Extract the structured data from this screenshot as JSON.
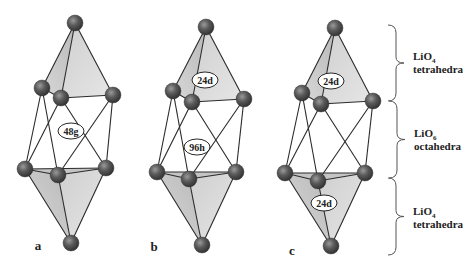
{
  "figure": {
    "background": "#ffffff",
    "colors": {
      "atom_fill": "#5a5a5a",
      "atom_highlight": "#8c8c8c",
      "atom_shadow": "#333333",
      "face_light": "#e2e2e2",
      "face_dark": "#bdbdbd",
      "edge": "#2a2a2a",
      "label_fill": "#ffffff",
      "text": "#222222",
      "brace": "#555555"
    },
    "atom_radius": 8
  },
  "panels": [
    {
      "id": "a",
      "label": "a",
      "label_pos": [
        38,
        250
      ],
      "atoms": {
        "top": [
          75,
          23
        ],
        "ul": [
          42,
          88
        ],
        "um": [
          61,
          98
        ],
        "ur": [
          113,
          95
        ],
        "ll": [
          25,
          169
        ],
        "lm": [
          58,
          175
        ],
        "lr": [
          106,
          168
        ],
        "bot": [
          71,
          243
        ]
      },
      "sites": [
        {
          "text": "48g",
          "pos": [
            71,
            131
          ],
          "rx": 13,
          "ry": 8
        }
      ]
    },
    {
      "id": "b",
      "label": "b",
      "label_pos": [
        154,
        251
      ],
      "atoms": {
        "top": [
          206,
          27
        ],
        "ul": [
          173,
          91
        ],
        "um": [
          192,
          102
        ],
        "ur": [
          244,
          99
        ],
        "ll": [
          157,
          172
        ],
        "lm": [
          189,
          179
        ],
        "lr": [
          236,
          172
        ],
        "bot": [
          202,
          245
        ]
      },
      "sites": [
        {
          "text": "24d",
          "pos": [
            205,
            80
          ],
          "rx": 13,
          "ry": 8
        },
        {
          "text": "96h",
          "pos": [
            197,
            147
          ],
          "rx": 13,
          "ry": 8
        }
      ]
    },
    {
      "id": "c",
      "label": "c",
      "label_pos": [
        292,
        255
      ],
      "atoms": {
        "top": [
          335,
          28
        ],
        "ul": [
          302,
          93
        ],
        "um": [
          321,
          104
        ],
        "ur": [
          373,
          101
        ],
        "ll": [
          285,
          173
        ],
        "lm": [
          318,
          181
        ],
        "lr": [
          365,
          173
        ],
        "bot": [
          331,
          246
        ]
      },
      "sites": [
        {
          "text": "24d",
          "pos": [
            331,
            81
          ],
          "rx": 13,
          "ry": 8
        },
        {
          "text": "24d",
          "pos": [
            324,
            203
          ],
          "rx": 13,
          "ry": 8
        }
      ]
    }
  ],
  "legend": [
    {
      "formula": "LiO",
      "subscript": "4",
      "descriptor": "tetrahedra",
      "brace": [
        25,
        101
      ],
      "tip_x": 404,
      "text_x": 413,
      "text_y": 60
    },
    {
      "formula": "LiO",
      "subscript": "6",
      "descriptor": "octahedra",
      "brace": [
        101,
        178
      ],
      "tip_x": 405,
      "text_x": 414,
      "text_y": 137
    },
    {
      "formula": "LiO",
      "subscript": "4",
      "descriptor": "tetrahedra",
      "brace": [
        178,
        255
      ],
      "tip_x": 404,
      "text_x": 413,
      "text_y": 215
    }
  ]
}
